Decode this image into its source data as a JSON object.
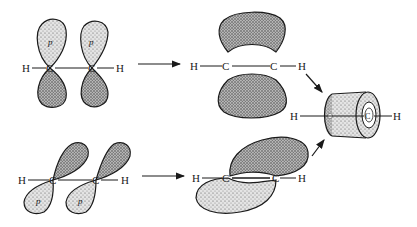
{
  "diagram": {
    "colors": {
      "ink": "#1a1a1a",
      "lobe_fill": "#d8d8d8",
      "lobe_shade": "#8a8a8a",
      "background": "#ffffff"
    },
    "top_row": {
      "left": {
        "atoms": [
          "H",
          "C",
          "C",
          "H"
        ],
        "orbital_labels": [
          "p",
          "p"
        ],
        "orientation": "vertical p orbitals"
      },
      "middle": {
        "atoms": [
          "H",
          "C",
          "C",
          "H"
        ],
        "label": "pi bond (vertical overlap)"
      }
    },
    "bottom_row": {
      "left": {
        "atoms": [
          "H",
          "C",
          "C",
          "H"
        ],
        "orbital_labels": [
          "p",
          "p"
        ],
        "orientation": "tilted p orbitals"
      },
      "middle": {
        "atoms": [
          "H",
          "C",
          "C",
          "H"
        ],
        "label": "pi bond (tilted overlap)"
      }
    },
    "result": {
      "atoms": [
        "H",
        "C",
        "H"
      ],
      "label": "cylindrical pi electron cloud"
    },
    "arrows": [
      {
        "from": "top-left",
        "to": "top-middle"
      },
      {
        "from": "bottom-left",
        "to": "bottom-middle"
      },
      {
        "from": "top-middle",
        "to": "result"
      },
      {
        "from": "bottom-middle",
        "to": "result"
      }
    ],
    "labels": {
      "H": "H",
      "C": "C",
      "p": "p"
    }
  }
}
